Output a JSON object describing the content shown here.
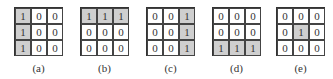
{
  "figure": {
    "panels": [
      {
        "label": "(a)",
        "x": 14,
        "grid": [
          [
            1,
            0,
            0
          ],
          [
            1,
            0,
            0
          ],
          [
            1,
            0,
            0
          ]
        ]
      },
      {
        "label": "(b)",
        "x": 80,
        "grid": [
          [
            1,
            1,
            1
          ],
          [
            0,
            0,
            0
          ],
          [
            0,
            0,
            0
          ]
        ]
      },
      {
        "label": "(c)",
        "x": 146,
        "grid": [
          [
            0,
            0,
            1
          ],
          [
            0,
            0,
            1
          ],
          [
            0,
            0,
            1
          ]
        ]
      },
      {
        "label": "(d)",
        "x": 212,
        "grid": [
          [
            0,
            0,
            0
          ],
          [
            0,
            0,
            0
          ],
          [
            1,
            1,
            1
          ]
        ]
      },
      {
        "label": "(e)",
        "x": 276,
        "grid": [
          [
            0,
            0,
            0
          ],
          [
            0,
            1,
            0
          ],
          [
            0,
            0,
            0
          ]
        ]
      }
    ],
    "colors": {
      "highlight": "#cfcfcf",
      "background": "#ffffff",
      "border": "#444444",
      "text": "#333333"
    }
  }
}
